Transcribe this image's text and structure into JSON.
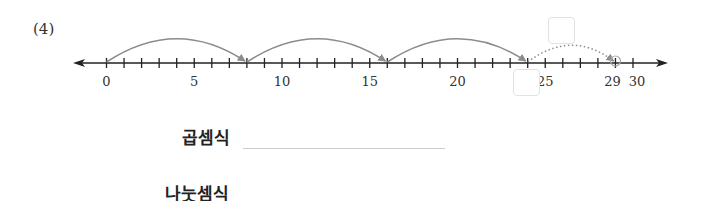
{
  "problem": {
    "number": "(4)"
  },
  "chart_data": {
    "type": "number-line",
    "min": 0,
    "max": 30,
    "tick_step": 1,
    "tick_labels": [
      {
        "value": 0,
        "label": "0"
      },
      {
        "value": 5,
        "label": "5"
      },
      {
        "value": 10,
        "label": "10"
      },
      {
        "value": 15,
        "label": "15"
      },
      {
        "value": 20,
        "label": "20"
      },
      {
        "value": 25,
        "label": "25"
      },
      {
        "value": 29,
        "label": "29"
      },
      {
        "value": 30,
        "label": "30"
      }
    ],
    "jumps": [
      {
        "from": 0,
        "to": 8,
        "style": "solid"
      },
      {
        "from": 8,
        "to": 16,
        "style": "solid"
      },
      {
        "from": 16,
        "to": 24,
        "style": "solid"
      },
      {
        "from": 24,
        "to": 29,
        "style": "dotted"
      }
    ],
    "highlighted_point": 29,
    "colors": {
      "axis": "#222222",
      "jump": "#8c8c8c",
      "box_border": "#e2e2e2"
    }
  },
  "answer_boxes": {
    "remainder_box": "",
    "position_box": ""
  },
  "equations": {
    "multiplication_label": "곱셈식",
    "multiplication_value": "",
    "division_label": "나눗셈식",
    "division_value": ""
  }
}
